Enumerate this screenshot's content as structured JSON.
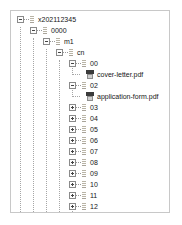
{
  "panel": {
    "name": "file-tree-panel",
    "background": "#ffffff",
    "border_color": "#c8c8c8"
  },
  "icons": {
    "expander_minus": "minus-box-icon",
    "expander_plus": "plus-box-icon",
    "folder": "folder-icon",
    "pdf": "pdf-file-icon"
  },
  "tree": {
    "nodes": [
      {
        "label": "x202112345",
        "depth": 0,
        "state": "expanded",
        "kind": "folder"
      },
      {
        "label": "0000",
        "depth": 1,
        "state": "expanded",
        "kind": "folder"
      },
      {
        "label": "m1",
        "depth": 2,
        "state": "expanded",
        "kind": "folder"
      },
      {
        "label": "cn",
        "depth": 3,
        "state": "expanded",
        "kind": "folder"
      },
      {
        "label": "00",
        "depth": 4,
        "state": "expanded",
        "kind": "folder"
      },
      {
        "label": "cover-letter.pdf",
        "depth": 5,
        "state": "leaf",
        "kind": "pdf"
      },
      {
        "label": "02",
        "depth": 4,
        "state": "expanded",
        "kind": "folder"
      },
      {
        "label": "application-form.pdf",
        "depth": 5,
        "state": "leaf",
        "kind": "pdf"
      },
      {
        "label": "03",
        "depth": 4,
        "state": "collapsed",
        "kind": "folder"
      },
      {
        "label": "04",
        "depth": 4,
        "state": "collapsed",
        "kind": "folder"
      },
      {
        "label": "05",
        "depth": 4,
        "state": "collapsed",
        "kind": "folder"
      },
      {
        "label": "06",
        "depth": 4,
        "state": "collapsed",
        "kind": "folder"
      },
      {
        "label": "07",
        "depth": 4,
        "state": "collapsed",
        "kind": "folder"
      },
      {
        "label": "08",
        "depth": 4,
        "state": "collapsed",
        "kind": "folder"
      },
      {
        "label": "09",
        "depth": 4,
        "state": "collapsed",
        "kind": "folder"
      },
      {
        "label": "10",
        "depth": 4,
        "state": "collapsed",
        "kind": "folder"
      },
      {
        "label": "11",
        "depth": 4,
        "state": "collapsed",
        "kind": "folder"
      },
      {
        "label": "12",
        "depth": 4,
        "state": "collapsed",
        "kind": "folder"
      },
      {
        "label": "cn-regional.xml",
        "depth": 5,
        "state": "leaf",
        "kind": "text"
      }
    ]
  }
}
